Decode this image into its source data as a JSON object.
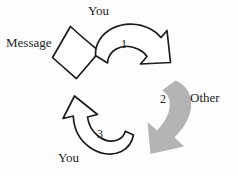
{
  "diagram": {
    "colors": {
      "stroke": "#1c1c1c",
      "gray_arrow": "#b3b3b3",
      "background": "#fdfdfd",
      "text": "#232323"
    },
    "labels": {
      "you_top": "You",
      "message": "Message",
      "step_1": "1",
      "step_2": "2",
      "other": "Other",
      "step_3": "3",
      "you_bottom": "You"
    },
    "shapes": {
      "message_box": "rotated-quadrilateral",
      "arrow_1": "black-outline-curved-arrow-right",
      "arrow_2": "gray-filled-curved-arrow-down-left",
      "arrow_3": "black-outline-curved-arrow-up-left"
    }
  }
}
